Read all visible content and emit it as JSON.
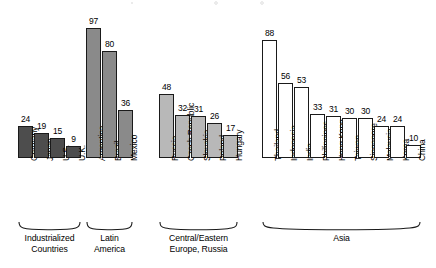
{
  "chart_data": {
    "type": "bar",
    "title": "",
    "xlabel": "",
    "ylabel": "",
    "ylim": [
      0,
      100
    ],
    "grid": false,
    "legend": "none",
    "orientation": "vertical",
    "value_labels": true,
    "categories": [
      "Germany",
      "Japan",
      "U.S.",
      "U.K.",
      "Argentina",
      "Brazil",
      "Mexico",
      "Russia",
      "Czech Republic",
      "Slovakia",
      "Poland",
      "Hungary",
      "Thailand",
      "Indonesia",
      "India",
      "Philippines",
      "Hong Kong",
      "Taiwan",
      "Singapore",
      "Malaysia",
      "Korea",
      "China"
    ],
    "values": [
      24,
      19,
      15,
      9,
      97,
      80,
      36,
      48,
      32,
      31,
      26,
      17,
      88,
      56,
      53,
      33,
      31,
      30,
      30,
      24,
      24,
      10
    ],
    "groups": [
      {
        "name": "Industrialized\nCountries",
        "fill": "#4d4d4d",
        "categories": [
          "Germany",
          "Japan",
          "U.S.",
          "U.K."
        ],
        "values": [
          24,
          19,
          15,
          9
        ]
      },
      {
        "name": "Latin\nAmerica",
        "fill": "#8a8a8a",
        "categories": [
          "Argentina",
          "Brazil",
          "Mexico"
        ],
        "values": [
          97,
          80,
          36
        ]
      },
      {
        "name": "Central/Eastern\nEurope, Russia",
        "fill": "#b8b8b8",
        "categories": [
          "Russia",
          "Czech Republic",
          "Slovakia",
          "Poland",
          "Hungary"
        ],
        "values": [
          48,
          32,
          31,
          26,
          17
        ]
      },
      {
        "name": "Asia",
        "fill": "#ffffff",
        "categories": [
          "Thailand",
          "Indonesia",
          "India",
          "Philippines",
          "Hong Kong",
          "Taiwan",
          "Singapore",
          "Malaysia",
          "Korea",
          "China"
        ],
        "values": [
          88,
          56,
          53,
          33,
          31,
          30,
          30,
          24,
          24,
          10
        ]
      }
    ]
  }
}
